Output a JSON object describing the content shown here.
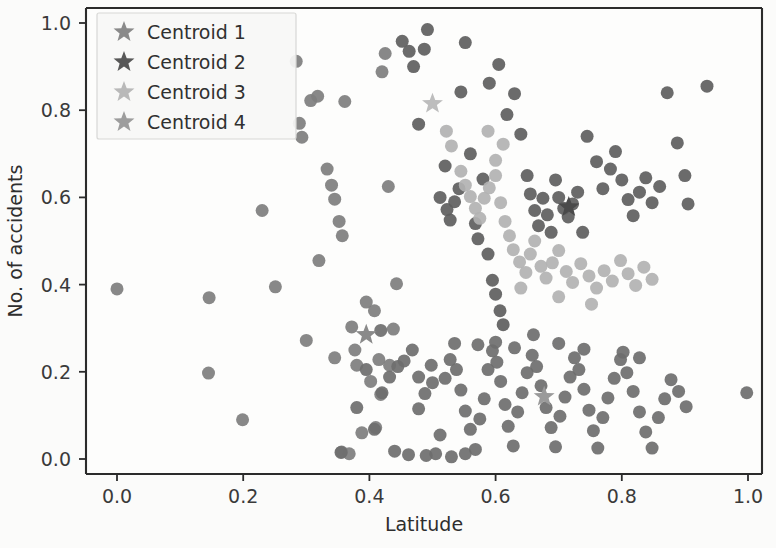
{
  "chart_data": {
    "type": "scatter",
    "title": "",
    "xlabel": "Latitude",
    "ylabel": "No. of accidents",
    "xlim": [
      -0.048,
      1.048
    ],
    "ylim": [
      -0.055,
      1.055
    ],
    "xticks": [
      0.0,
      0.2,
      0.4,
      0.6,
      0.8,
      1.0
    ],
    "yticks": [
      0.0,
      0.2,
      0.4,
      0.6,
      0.8,
      1.0
    ],
    "xtick_labels": [
      "0.0",
      "0.2",
      "0.4",
      "0.6",
      "0.8",
      "1.0"
    ],
    "ytick_labels": [
      "0.0",
      "0.2",
      "0.4",
      "0.6",
      "0.8",
      "1.0"
    ],
    "grid": false,
    "legend_position": "upper left",
    "marker": "circle",
    "marker_size": 13,
    "centroid_marker": "star",
    "centroid_marker_size": 22,
    "legend": [
      {
        "label": "Centroid 1",
        "color": "#8a8a8a"
      },
      {
        "label": "Centroid 2",
        "color": "#585858"
      },
      {
        "label": "Centroid 3",
        "color": "#b9b9b9"
      },
      {
        "label": "Centroid 4",
        "color": "#9d9d9d"
      }
    ],
    "centroids": [
      {
        "name": "Centroid 1",
        "x": 0.395,
        "y": 0.285,
        "color": "#8a8a8a"
      },
      {
        "name": "Centroid 2",
        "x": 0.716,
        "y": 0.578,
        "color": "#4a4a4a"
      },
      {
        "name": "Centroid 3",
        "x": 0.5,
        "y": 0.815,
        "color": "#bdbdbd"
      },
      {
        "name": "Centroid 4",
        "x": 0.677,
        "y": 0.143,
        "color": "#9a9a9a"
      }
    ],
    "series": [
      {
        "name": "Cluster 1",
        "color": "#7e7e7e",
        "points": [
          [
            0.0,
            0.39
          ],
          [
            0.146,
            0.37
          ],
          [
            0.145,
            0.197
          ],
          [
            0.23,
            0.57
          ],
          [
            0.251,
            0.395
          ],
          [
            0.199,
            0.09
          ],
          [
            0.284,
            0.912
          ],
          [
            0.289,
            0.77
          ],
          [
            0.293,
            0.738
          ],
          [
            0.307,
            0.822
          ],
          [
            0.318,
            0.832
          ],
          [
            0.333,
            0.665
          ],
          [
            0.34,
            0.628
          ],
          [
            0.345,
            0.596
          ],
          [
            0.352,
            0.545
          ],
          [
            0.357,
            0.512
          ],
          [
            0.3,
            0.272
          ],
          [
            0.345,
            0.232
          ],
          [
            0.356,
            0.016
          ],
          [
            0.368,
            0.012
          ],
          [
            0.372,
            0.303
          ],
          [
            0.377,
            0.25
          ],
          [
            0.38,
            0.215
          ],
          [
            0.388,
            0.06
          ],
          [
            0.395,
            0.36
          ],
          [
            0.402,
            0.178
          ],
          [
            0.408,
            0.34
          ],
          [
            0.41,
            0.072
          ],
          [
            0.415,
            0.228
          ],
          [
            0.418,
            0.148
          ],
          [
            0.361,
            0.82
          ],
          [
            0.42,
            0.888
          ],
          [
            0.425,
            0.93
          ],
          [
            0.43,
            0.625
          ],
          [
            0.432,
            0.215
          ],
          [
            0.438,
            0.298
          ],
          [
            0.32,
            0.455
          ],
          [
            0.443,
            0.402
          ]
        ]
      },
      {
        "name": "Cluster 2",
        "color": "#5e5e5e",
        "points": [
          [
            0.452,
            0.958
          ],
          [
            0.463,
            0.935
          ],
          [
            0.47,
            0.9
          ],
          [
            0.478,
            0.768
          ],
          [
            0.487,
            0.94
          ],
          [
            0.492,
            0.985
          ],
          [
            0.512,
            0.6
          ],
          [
            0.52,
            0.672
          ],
          [
            0.523,
            0.572
          ],
          [
            0.528,
            0.548
          ],
          [
            0.535,
            0.59
          ],
          [
            0.542,
            0.62
          ],
          [
            0.545,
            0.842
          ],
          [
            0.552,
            0.955
          ],
          [
            0.56,
            0.7
          ],
          [
            0.568,
            0.54
          ],
          [
            0.572,
            0.505
          ],
          [
            0.58,
            0.642
          ],
          [
            0.588,
            0.47
          ],
          [
            0.595,
            0.41
          ],
          [
            0.6,
            0.378
          ],
          [
            0.607,
            0.34
          ],
          [
            0.612,
            0.308
          ],
          [
            0.59,
            0.862
          ],
          [
            0.605,
            0.905
          ],
          [
            0.618,
            0.79
          ],
          [
            0.63,
            0.838
          ],
          [
            0.64,
            0.745
          ],
          [
            0.65,
            0.65
          ],
          [
            0.655,
            0.608
          ],
          [
            0.662,
            0.57
          ],
          [
            0.668,
            0.535
          ],
          [
            0.675,
            0.598
          ],
          [
            0.682,
            0.56
          ],
          [
            0.688,
            0.52
          ],
          [
            0.695,
            0.64
          ],
          [
            0.7,
            0.6
          ],
          [
            0.708,
            0.575
          ],
          [
            0.715,
            0.555
          ],
          [
            0.722,
            0.585
          ],
          [
            0.73,
            0.612
          ],
          [
            0.738,
            0.52
          ],
          [
            0.745,
            0.74
          ],
          [
            0.76,
            0.682
          ],
          [
            0.77,
            0.62
          ],
          [
            0.782,
            0.665
          ],
          [
            0.79,
            0.705
          ],
          [
            0.8,
            0.64
          ],
          [
            0.81,
            0.595
          ],
          [
            0.818,
            0.558
          ],
          [
            0.828,
            0.612
          ],
          [
            0.838,
            0.645
          ],
          [
            0.848,
            0.588
          ],
          [
            0.86,
            0.625
          ],
          [
            0.872,
            0.84
          ],
          [
            0.888,
            0.725
          ],
          [
            0.9,
            0.65
          ],
          [
            0.935,
            0.855
          ],
          [
            0.905,
            0.585
          ]
        ]
      },
      {
        "name": "Cluster 3",
        "color": "#b2b2b2",
        "points": [
          [
            0.522,
            0.752
          ],
          [
            0.53,
            0.718
          ],
          [
            0.545,
            0.66
          ],
          [
            0.552,
            0.628
          ],
          [
            0.56,
            0.602
          ],
          [
            0.568,
            0.575
          ],
          [
            0.575,
            0.552
          ],
          [
            0.582,
            0.598
          ],
          [
            0.59,
            0.622
          ],
          [
            0.6,
            0.65
          ],
          [
            0.608,
            0.588
          ],
          [
            0.615,
            0.545
          ],
          [
            0.622,
            0.512
          ],
          [
            0.628,
            0.48
          ],
          [
            0.638,
            0.452
          ],
          [
            0.648,
            0.428
          ],
          [
            0.655,
            0.47
          ],
          [
            0.662,
            0.5
          ],
          [
            0.672,
            0.442
          ],
          [
            0.68,
            0.415
          ],
          [
            0.69,
            0.45
          ],
          [
            0.7,
            0.478
          ],
          [
            0.712,
            0.43
          ],
          [
            0.722,
            0.405
          ],
          [
            0.735,
            0.448
          ],
          [
            0.748,
            0.42
          ],
          [
            0.76,
            0.392
          ],
          [
            0.772,
            0.432
          ],
          [
            0.785,
            0.408
          ],
          [
            0.798,
            0.455
          ],
          [
            0.81,
            0.425
          ],
          [
            0.822,
            0.398
          ],
          [
            0.835,
            0.44
          ],
          [
            0.848,
            0.412
          ],
          [
            0.7,
            0.372
          ],
          [
            0.752,
            0.355
          ],
          [
            0.64,
            0.392
          ],
          [
            0.6,
            0.685
          ],
          [
            0.588,
            0.752
          ],
          [
            0.612,
            0.722
          ]
        ]
      },
      {
        "name": "Cluster 4",
        "color": "#6e6e6e",
        "points": [
          [
            0.355,
            0.015
          ],
          [
            0.38,
            0.118
          ],
          [
            0.395,
            0.205
          ],
          [
            0.408,
            0.068
          ],
          [
            0.42,
            0.152
          ],
          [
            0.432,
            0.188
          ],
          [
            0.445,
            0.212
          ],
          [
            0.455,
            0.225
          ],
          [
            0.468,
            0.25
          ],
          [
            0.478,
            0.188
          ],
          [
            0.488,
            0.15
          ],
          [
            0.498,
            0.215
          ],
          [
            0.505,
            0.012
          ],
          [
            0.512,
            0.055
          ],
          [
            0.52,
            0.185
          ],
          [
            0.528,
            0.228
          ],
          [
            0.538,
            0.205
          ],
          [
            0.545,
            0.158
          ],
          [
            0.552,
            0.11
          ],
          [
            0.56,
            0.068
          ],
          [
            0.568,
            0.022
          ],
          [
            0.575,
            0.092
          ],
          [
            0.582,
            0.138
          ],
          [
            0.588,
            0.205
          ],
          [
            0.595,
            0.248
          ],
          [
            0.602,
            0.222
          ],
          [
            0.608,
            0.178
          ],
          [
            0.615,
            0.125
          ],
          [
            0.62,
            0.075
          ],
          [
            0.628,
            0.03
          ],
          [
            0.635,
            0.108
          ],
          [
            0.642,
            0.152
          ],
          [
            0.65,
            0.198
          ],
          [
            0.658,
            0.238
          ],
          [
            0.665,
            0.212
          ],
          [
            0.672,
            0.168
          ],
          [
            0.68,
            0.118
          ],
          [
            0.688,
            0.072
          ],
          [
            0.695,
            0.028
          ],
          [
            0.702,
            0.098
          ],
          [
            0.71,
            0.142
          ],
          [
            0.718,
            0.188
          ],
          [
            0.725,
            0.232
          ],
          [
            0.732,
            0.205
          ],
          [
            0.74,
            0.16
          ],
          [
            0.748,
            0.112
          ],
          [
            0.755,
            0.065
          ],
          [
            0.762,
            0.025
          ],
          [
            0.77,
            0.095
          ],
          [
            0.778,
            0.14
          ],
          [
            0.788,
            0.185
          ],
          [
            0.798,
            0.228
          ],
          [
            0.808,
            0.198
          ],
          [
            0.818,
            0.155
          ],
          [
            0.828,
            0.108
          ],
          [
            0.838,
            0.062
          ],
          [
            0.848,
            0.025
          ],
          [
            0.858,
            0.095
          ],
          [
            0.868,
            0.138
          ],
          [
            0.878,
            0.182
          ],
          [
            0.89,
            0.155
          ],
          [
            0.902,
            0.12
          ],
          [
            0.418,
            0.295
          ],
          [
            0.44,
            0.018
          ],
          [
            0.462,
            0.01
          ],
          [
            0.49,
            0.008
          ],
          [
            0.53,
            0.005
          ],
          [
            0.572,
            0.262
          ],
          [
            0.6,
            0.268
          ],
          [
            0.63,
            0.255
          ],
          [
            0.7,
            0.265
          ],
          [
            0.74,
            0.252
          ],
          [
            0.66,
            0.285
          ],
          [
            0.998,
            0.152
          ],
          [
            0.802,
            0.245
          ],
          [
            0.828,
            0.232
          ],
          [
            0.478,
            0.115
          ],
          [
            0.5,
            0.175
          ],
          [
            0.535,
            0.265
          ],
          [
            0.552,
            0.012
          ]
        ]
      }
    ]
  },
  "axes": {
    "xlabel": "Latitude",
    "ylabel": "No. of accidents"
  }
}
